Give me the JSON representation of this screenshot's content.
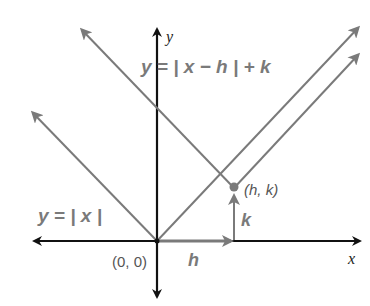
{
  "diagram": {
    "type": "absolute-value-translation",
    "axes": {
      "x_label": "x",
      "y_label": "y"
    },
    "equations": {
      "parent": "y = | x |",
      "translated": "y = | x − h | + k"
    },
    "points": {
      "origin": "(0, 0)",
      "vertex": "(h, k)"
    },
    "shift_labels": {
      "horizontal": "h",
      "vertical": "k"
    },
    "colors": {
      "axes": "#111111",
      "graphs": "#7a7a7a",
      "text": "#7a7a7a"
    }
  }
}
